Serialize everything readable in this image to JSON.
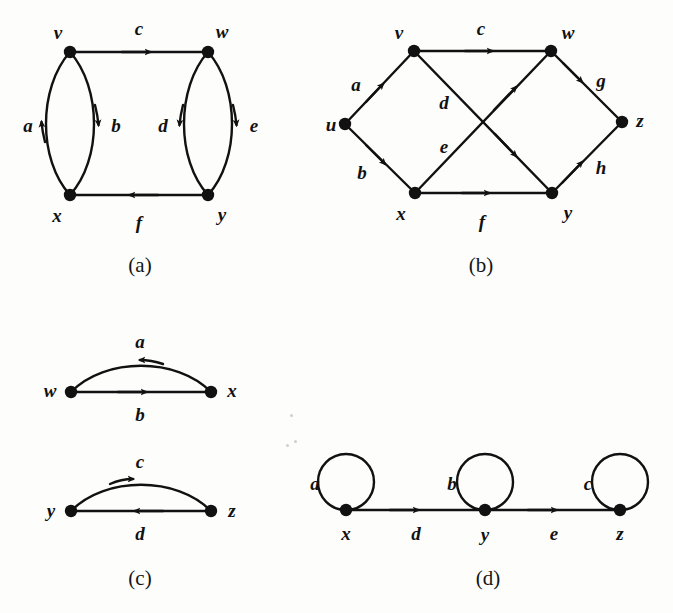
{
  "figure": {
    "background_color": "#fdfdfc",
    "ink_color": "#111111",
    "width": 673,
    "height": 613
  },
  "captions": {
    "a": "(a)",
    "b": "(b)",
    "c": "(c)",
    "d": "(d)"
  },
  "panels": {
    "a": {
      "caption": "(a)",
      "vertices": [
        {
          "id": "v",
          "label": "v",
          "x": 70,
          "y": 52,
          "label_x": 58,
          "label_y": 32
        },
        {
          "id": "w",
          "label": "w",
          "x": 208,
          "y": 52,
          "label_x": 222,
          "label_y": 31
        },
        {
          "id": "x",
          "label": "x",
          "x": 70,
          "y": 195,
          "label_x": 57,
          "label_y": 215
        },
        {
          "id": "y",
          "label": "y",
          "x": 208,
          "y": 195,
          "label_x": 222,
          "label_y": 214
        }
      ],
      "edges": [
        {
          "id": "c",
          "label": "c",
          "from": "v",
          "to": "w",
          "shape": "straight",
          "label_x": 139,
          "label_y": 28
        },
        {
          "id": "a",
          "label": "a",
          "from": "x",
          "to": "v",
          "shape": "arc-left",
          "label_x": 28,
          "label_y": 125
        },
        {
          "id": "b",
          "label": "b",
          "from": "v",
          "to": "x",
          "shape": "arc-right",
          "label_x": 116,
          "label_y": 125
        },
        {
          "id": "d",
          "label": "d",
          "from": "w",
          "to": "y",
          "shape": "arc-left",
          "label_x": 163,
          "label_y": 125
        },
        {
          "id": "e",
          "label": "e",
          "from": "w",
          "to": "y",
          "shape": "arc-right",
          "label_x": 254,
          "label_y": 125
        },
        {
          "id": "f",
          "label": "f",
          "from": "y",
          "to": "x",
          "shape": "straight",
          "label_x": 139,
          "label_y": 222
        }
      ]
    },
    "b": {
      "caption": "(b)",
      "vertices": [
        {
          "id": "u",
          "label": "u",
          "x": 345,
          "y": 124,
          "label_x": 331,
          "label_y": 124
        },
        {
          "id": "v",
          "label": "v",
          "x": 414,
          "y": 51,
          "label_x": 399,
          "label_y": 32
        },
        {
          "id": "w",
          "label": "w",
          "x": 551,
          "y": 51,
          "label_x": 568,
          "label_y": 32
        },
        {
          "id": "x",
          "label": "x",
          "x": 415,
          "y": 193,
          "label_x": 401,
          "label_y": 213
        },
        {
          "id": "y",
          "label": "y",
          "x": 552,
          "y": 193,
          "label_x": 568,
          "label_y": 212
        },
        {
          "id": "z",
          "label": "z",
          "x": 622,
          "y": 122,
          "label_x": 640,
          "label_y": 120
        }
      ],
      "edges": [
        {
          "id": "a",
          "label": "a",
          "from": "u",
          "to": "v",
          "label_x": 356,
          "label_y": 84
        },
        {
          "id": "b",
          "label": "b",
          "from": "u",
          "to": "x",
          "label_x": 362,
          "label_y": 172
        },
        {
          "id": "c",
          "label": "c",
          "from": "v",
          "to": "w",
          "label_x": 481,
          "label_y": 28
        },
        {
          "id": "d",
          "label": "d",
          "from": "v",
          "to": "y",
          "label_x": 444,
          "label_y": 102
        },
        {
          "id": "e",
          "label": "e",
          "from": "x",
          "to": "w",
          "label_x": 444,
          "label_y": 146
        },
        {
          "id": "f",
          "label": "f",
          "from": "x",
          "to": "y",
          "label_x": 482,
          "label_y": 221
        },
        {
          "id": "g",
          "label": "g",
          "from": "w",
          "to": "z",
          "label_x": 601,
          "label_y": 80
        },
        {
          "id": "h",
          "label": "h",
          "from": "y",
          "to": "z",
          "label_x": 601,
          "label_y": 167
        }
      ]
    },
    "c": {
      "caption": "(c)",
      "vertices": [
        {
          "id": "w",
          "label": "w",
          "x": 71,
          "y": 392,
          "label_x": 50,
          "label_y": 390
        },
        {
          "id": "x",
          "label": "x",
          "x": 211,
          "y": 392,
          "label_x": 232,
          "label_y": 390
        },
        {
          "id": "y",
          "label": "y",
          "x": 71,
          "y": 511,
          "label_x": 51,
          "label_y": 510
        },
        {
          "id": "z",
          "label": "z",
          "x": 211,
          "y": 511,
          "label_x": 232,
          "label_y": 510
        }
      ],
      "edges": [
        {
          "id": "a",
          "label": "a",
          "from": "x",
          "to": "w",
          "shape": "arc-up",
          "label_x": 140,
          "label_y": 341
        },
        {
          "id": "b",
          "label": "b",
          "from": "w",
          "to": "x",
          "shape": "straight",
          "label_x": 140,
          "label_y": 414
        },
        {
          "id": "c",
          "label": "c",
          "from": "y",
          "to": "z",
          "shape": "arc-up",
          "label_x": 140,
          "label_y": 461
        },
        {
          "id": "d",
          "label": "d",
          "from": "z",
          "to": "y",
          "shape": "straight",
          "label_x": 140,
          "label_y": 533
        }
      ]
    },
    "d": {
      "caption": "(d)",
      "vertices": [
        {
          "id": "x",
          "label": "x",
          "x": 346,
          "y": 510,
          "label_x": 346,
          "label_y": 533
        },
        {
          "id": "y",
          "label": "y",
          "x": 485,
          "y": 510,
          "label_x": 485,
          "label_y": 534
        },
        {
          "id": "z",
          "label": "z",
          "x": 620,
          "y": 510,
          "label_x": 620,
          "label_y": 533
        }
      ],
      "edges": [
        {
          "id": "a",
          "label": "a",
          "from": "x",
          "to": "x",
          "shape": "loop",
          "label_x": 315,
          "label_y": 483
        },
        {
          "id": "b",
          "label": "b",
          "from": "y",
          "to": "y",
          "shape": "loop",
          "label_x": 452,
          "label_y": 483
        },
        {
          "id": "c",
          "label": "c",
          "from": "z",
          "to": "z",
          "shape": "loop",
          "label_x": 588,
          "label_y": 483
        },
        {
          "id": "d",
          "label": "d",
          "from": "x",
          "to": "y",
          "shape": "straight",
          "label_x": 416,
          "label_y": 533
        },
        {
          "id": "e",
          "label": "e",
          "from": "y",
          "to": "z",
          "shape": "straight",
          "label_x": 554,
          "label_y": 533
        }
      ]
    }
  }
}
